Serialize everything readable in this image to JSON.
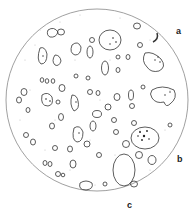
{
  "figure": {
    "labels": {
      "a": "a",
      "b": "b",
      "c": "c"
    },
    "colors": {
      "ink": "#333333",
      "stipple": "#bbbbbb",
      "background": "#ffffff"
    }
  }
}
